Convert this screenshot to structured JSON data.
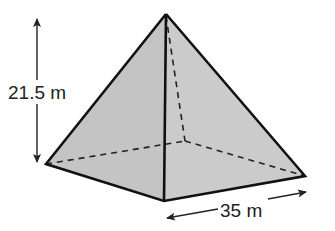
{
  "diagram": {
    "type": "square-based pyramid",
    "labels": {
      "height": "21.5 m",
      "base_side": "35 m"
    },
    "colors": {
      "face_fill": "#c8c8c8",
      "edge": "#111111",
      "background": "#ffffff"
    },
    "vertices": {
      "apex": [
        166,
        14
      ],
      "base_left": [
        46,
        164
      ],
      "base_front": [
        164,
        201
      ],
      "base_right": [
        305,
        176
      ],
      "base_back_hidden": [
        185,
        141
      ]
    }
  }
}
